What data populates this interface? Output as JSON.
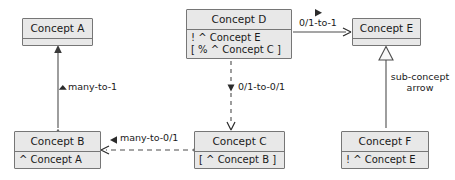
{
  "diagram": {
    "type": "uml-class-diagram",
    "colors": {
      "node_fill": "#e8e8e8",
      "node_border": "#767676",
      "edge": "#4d4d4d",
      "text": "#1a1a1a",
      "background": "#ffffff"
    },
    "nodes": [
      {
        "id": "concept-a",
        "title": "Concept A",
        "attributes": [],
        "x": 22,
        "y": 18,
        "w": 71,
        "h": 28
      },
      {
        "id": "concept-b",
        "title": "Concept B",
        "attributes": [
          "^ Concept A"
        ],
        "x": 14,
        "y": 131,
        "w": 87,
        "h": 38
      },
      {
        "id": "concept-c",
        "title": "Concept C",
        "attributes": [
          "[ ^ Concept B ]"
        ],
        "x": 194,
        "y": 131,
        "w": 91,
        "h": 38
      },
      {
        "id": "concept-d",
        "title": "Concept D",
        "attributes": [
          "! ^ Concept E",
          "[ % ^ Concept C ]"
        ],
        "x": 186,
        "y": 9,
        "w": 106,
        "h": 50
      },
      {
        "id": "concept-e",
        "title": "Concept E",
        "attributes": [],
        "x": 352,
        "y": 18,
        "w": 69,
        "h": 28
      },
      {
        "id": "concept-f",
        "title": "Concept F",
        "attributes": [
          "! ^ Concept E"
        ],
        "x": 341,
        "y": 131,
        "w": 88,
        "h": 38
      }
    ],
    "edges": [
      {
        "id": "edge-b-to-a",
        "from": "concept-b",
        "to": "concept-a",
        "label": "many-to-1",
        "style": "solid",
        "arrow_head": "filled-triangle",
        "tail_head": "hollow-triangle",
        "label_x": 62,
        "label_y": 84
      },
      {
        "id": "edge-c-to-b",
        "from": "concept-c",
        "to": "concept-b",
        "label": "many-to-0/1",
        "style": "dashed",
        "arrow_head": "open-arrow",
        "tail_head": "hollow-triangle",
        "label_x": 124,
        "label_y": 135
      },
      {
        "id": "edge-d-to-c",
        "from": "concept-d",
        "to": "concept-c",
        "label": "0/1-to-0/1",
        "style": "dashed",
        "arrow_head": "open-arrow",
        "label_x": 238,
        "label_y": 88
      },
      {
        "id": "edge-d-to-e",
        "from": "concept-d",
        "to": "concept-e",
        "label": "0/1-to-1",
        "style": "solid",
        "arrow_head": "open-arrow",
        "label_x": 303,
        "label_y": 18
      },
      {
        "id": "edge-f-to-e",
        "from": "concept-f",
        "to": "concept-e",
        "label": "sub-concept arrow",
        "style": "solid",
        "arrow_head": "hollow-triangle",
        "label_x": 370,
        "label_y": 77
      }
    ]
  }
}
